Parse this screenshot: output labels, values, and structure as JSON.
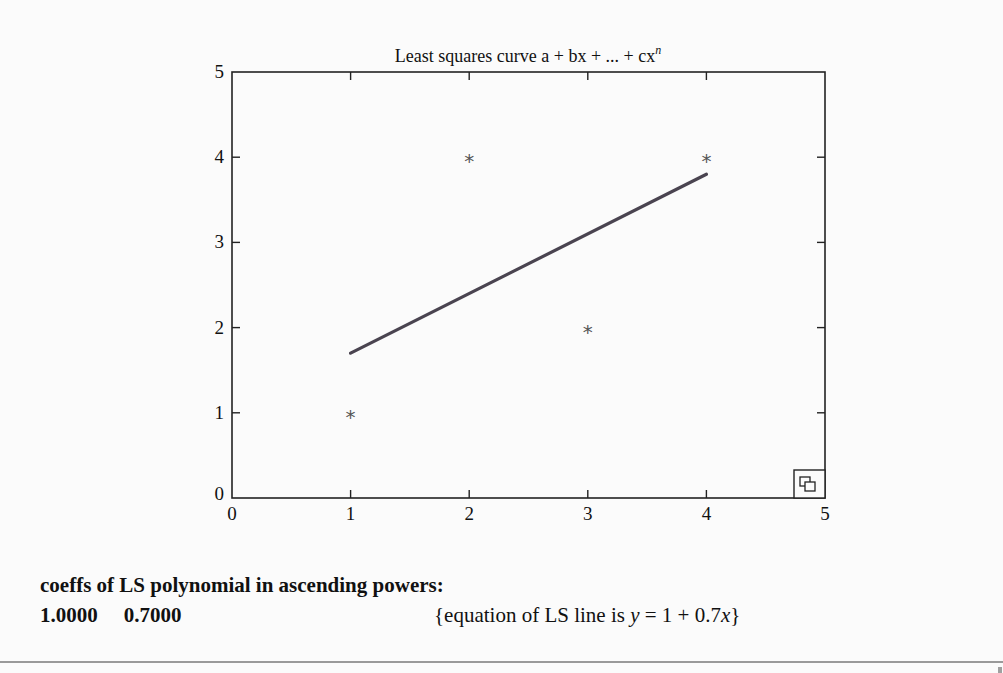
{
  "chart_data": {
    "type": "scatter",
    "title": "Least squares curve a + bx + ... + cx",
    "title_superscript": "n",
    "xlabel": "",
    "ylabel": "",
    "xlim": [
      0,
      5
    ],
    "ylim": [
      0,
      5
    ],
    "x_ticks": [
      0,
      1,
      2,
      3,
      4,
      5
    ],
    "y_ticks": [
      0,
      1,
      2,
      3,
      4,
      5
    ],
    "grid": false,
    "legend": null,
    "series": [
      {
        "name": "data points",
        "type": "scatter",
        "marker": "*",
        "x": [
          1,
          2,
          3,
          4
        ],
        "y": [
          1,
          4,
          2,
          4
        ]
      },
      {
        "name": "least squares line",
        "type": "line",
        "color": "#4a4450",
        "x": [
          1,
          4
        ],
        "y": [
          1.7,
          3.8
        ]
      }
    ],
    "coefficients": [
      1.0,
      0.7
    ]
  },
  "chart": {
    "title": "Least squares curve a + bx + ... + cx",
    "title_sup": "n",
    "x_tick_labels": [
      "0",
      "1",
      "2",
      "3",
      "4",
      "5"
    ],
    "y_tick_labels": [
      "0",
      "1",
      "2",
      "3",
      "4",
      "5"
    ],
    "marker_glyph": "*",
    "corner_icon": "copy-icon",
    "colors": {
      "axes": "#222222",
      "line": "#4a4450",
      "marker": "#555555"
    }
  },
  "output": {
    "heading": "coeffs of LS polynomial in ascending powers:",
    "coeff_values": [
      "1.0000",
      "0.7000"
    ],
    "equation_prefix": "{equation of LS line is ",
    "equation_var_y": "y",
    "equation_middle": " = 1 + 0.7",
    "equation_var_x": "x",
    "equation_suffix": "}"
  }
}
